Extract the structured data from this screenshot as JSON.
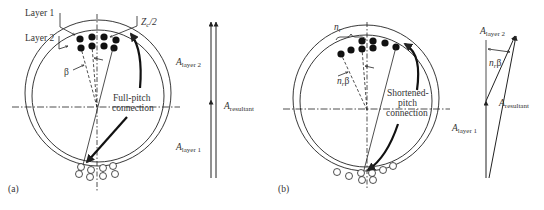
{
  "panel_a": {
    "tag": "(a)",
    "layer1_label": "Layer 1",
    "layer2_label": "Layer 2",
    "zc_label": "Z",
    "zc_sub": "c",
    "zc_suffix": "/2",
    "beta_label": "β",
    "connection_line1": "Full-pitch",
    "connection_line2": "connection",
    "phasor": {
      "layer2_A": "A",
      "layer2_sub": "layer 2",
      "resultant_A": "A",
      "resultant_sub": "resultant",
      "layer1_A": "A",
      "layer1_sub": "layer 1"
    }
  },
  "panel_b": {
    "tag": "(b)",
    "nr_label": "n",
    "nr_sub": "r",
    "nrbeta_label": "n",
    "nrbeta_sub": "r",
    "nrbeta_beta": "β",
    "connection_line1": "Shortened-",
    "connection_line2": "pitch",
    "connection_line3": "connection",
    "phasor": {
      "layer2_A": "A",
      "layer2_sub": "layer 2",
      "angle_n": "n",
      "angle_sub": "r",
      "angle_beta": "β",
      "resultant_A": "A",
      "resultant_sub": "resultant",
      "layer1_A": "A",
      "layer1_sub": "layer 1"
    }
  },
  "colors": {
    "ink": "#222222",
    "background": "#ffffff"
  }
}
